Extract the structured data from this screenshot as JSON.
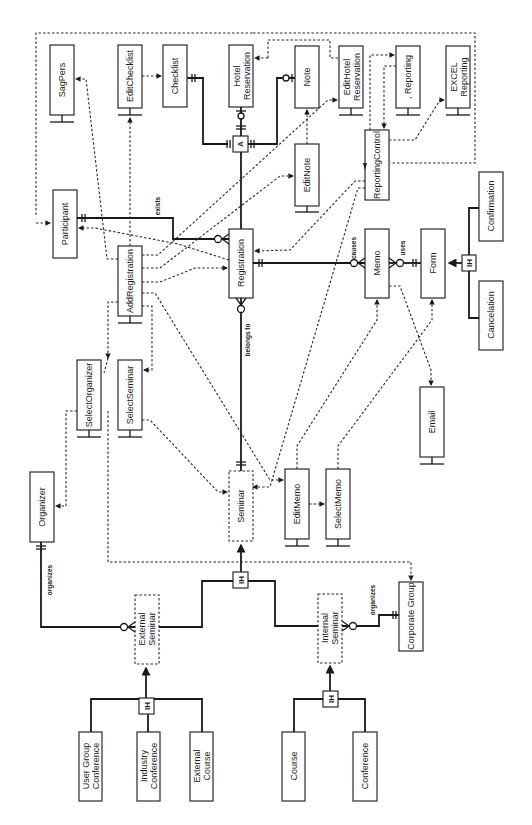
{
  "diagram": {
    "type": "entity-relationship / component diagram (rotated 90deg)",
    "entities": {
      "sagpers": "SagPers",
      "editchecklist": "EditChecklist",
      "checklist": "Checklist",
      "hotel_reservation": [
        "Hotel",
        "Reservation"
      ],
      "note": "Note",
      "edithotel_reservation": [
        "EditHotel",
        "Reservation"
      ],
      "reporting": ", Reporting",
      "excel_reporting": [
        "EXCEL",
        "Reporting"
      ],
      "reportingcontrol": "ReportingControl",
      "editnote": "EditNote",
      "participant": "Participant",
      "addregistration": "AddRegistration",
      "registration": "Registration",
      "memo": "Memo",
      "form": "Form",
      "confirmation": "Confirmation",
      "cancelation": "Cancelation",
      "selectorganizer": "SelectOrganizer",
      "selectseminar": "SelectSeminar",
      "email": "Email",
      "organizer": "Organizer",
      "seminar": "Seminar",
      "editmemo": "EditMemo",
      "selectmemo": "SelectMemo",
      "external_seminar": [
        "External",
        "Seminar"
      ],
      "internal_seminar": [
        "Internal",
        "Seminar"
      ],
      "corporate_group": "Corporate Group",
      "user_group_conference": [
        "User Group",
        "Conference"
      ],
      "industry_conference": [
        "Industry",
        "Conference"
      ],
      "external_course": [
        "External",
        "Course"
      ],
      "course": "Course",
      "conference": "Conference"
    },
    "relationships": {
      "exists": "exists",
      "belongs_to": "belongs to",
      "causes": "causes",
      "uses": "uses",
      "organizes_external": "organizes",
      "organizes_internal": "organizes"
    },
    "symbols": {
      "aggregation": "A",
      "inheritance": "IH"
    }
  }
}
